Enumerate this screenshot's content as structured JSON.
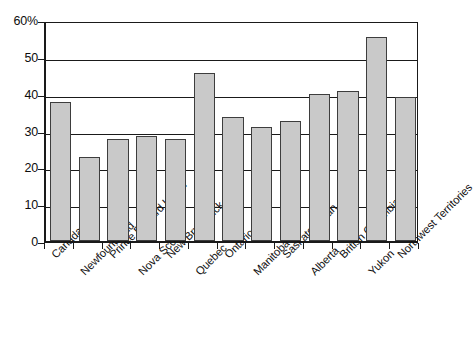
{
  "chart_data": {
    "type": "bar",
    "title": "",
    "subtitle": "",
    "xlabel": "",
    "ylabel": "",
    "ylim": [
      0,
      60
    ],
    "yticks": [
      0,
      10,
      20,
      30,
      40,
      50,
      60
    ],
    "ytick_labels": [
      "0",
      "10",
      "20",
      "30",
      "40",
      "50",
      "60%"
    ],
    "grid": true,
    "legend": null,
    "categories": [
      "Canada",
      "Newfoundland",
      "Prince Edward Island",
      "Nova Scotia",
      "New Brunswick",
      "Quebec",
      "Ontario",
      "Manitoba",
      "Saskatchewan",
      "Alberta",
      "British Columbia",
      "Yukon",
      "Northwest Territories"
    ],
    "values": [
      37.7,
      22.7,
      27.6,
      28.4,
      27.6,
      45.6,
      33.7,
      31.0,
      32.5,
      39.8,
      40.6,
      55.5,
      39.0
    ],
    "bar_color": "#c9c9c9",
    "bar_edge_color": "#3d3d3d",
    "axis_color": "#1a1a1a"
  }
}
